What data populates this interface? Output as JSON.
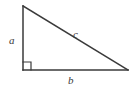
{
  "figure": {
    "name": "right-triangle",
    "background_color": "#ffffff",
    "stroke_color": "#3a3a3a",
    "stroke_width": 1.5,
    "width": 133,
    "height": 87
  },
  "geometry": {
    "vertices": {
      "top": {
        "x": 23,
        "y": 6
      },
      "bottom_left": {
        "x": 23,
        "y": 70
      },
      "bottom_right": {
        "x": 128,
        "y": 70
      }
    },
    "right_angle_marker": {
      "at": "bottom_left",
      "size": 8,
      "points": "23,62 31,62 31,70"
    },
    "sides": {
      "vertical_leg": {
        "from": "top",
        "to": "bottom_left",
        "label": "a"
      },
      "base_leg": {
        "from": "bottom_left",
        "to": "bottom_right",
        "label": "b"
      },
      "hypotenuse": {
        "from": "top",
        "to": "bottom_right",
        "label": "c"
      }
    }
  },
  "labels": {
    "leg_a": {
      "text": "a",
      "x": 9,
      "y": 44
    },
    "leg_b": {
      "text": "b",
      "x": 68,
      "y": 84
    },
    "hypotenuse_c": {
      "text": "c",
      "x": 73,
      "y": 38
    }
  }
}
